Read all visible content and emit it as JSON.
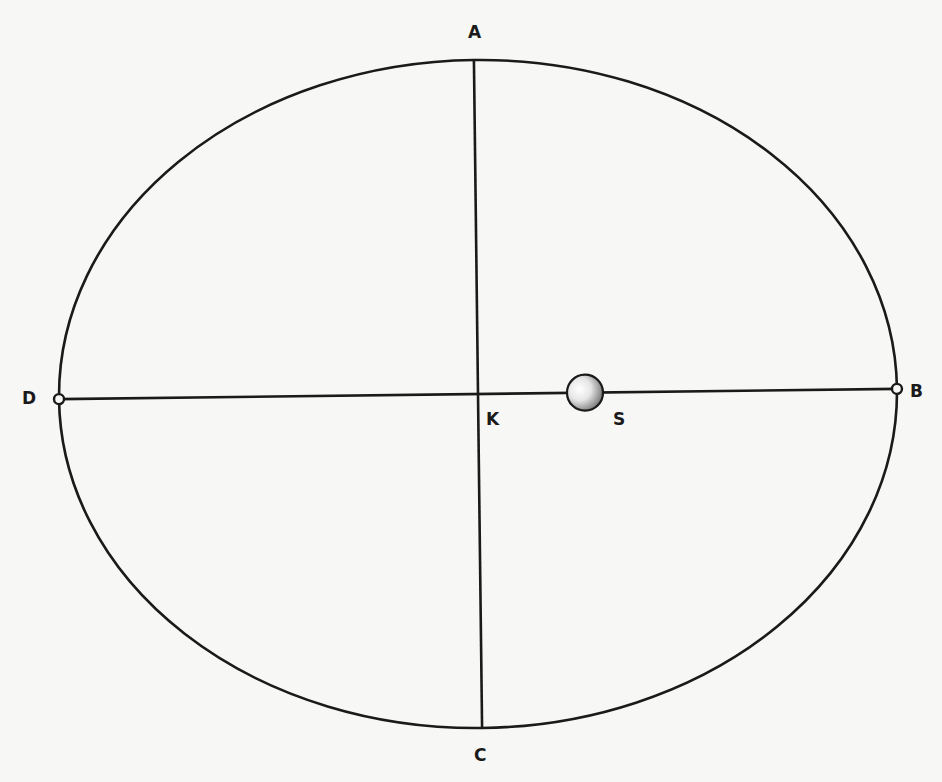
{
  "diagram": {
    "labels": {
      "top": "A",
      "right": "B",
      "bottom": "C",
      "left": "D",
      "center": "K",
      "sun": "S"
    },
    "colors": {
      "line": "#1a1a1a",
      "background": "#f7f7f5"
    }
  }
}
